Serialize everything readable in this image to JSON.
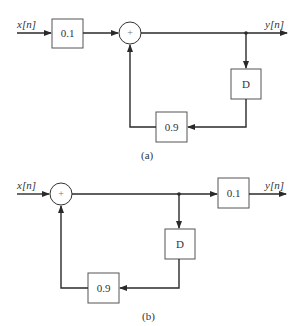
{
  "diagram_a": {
    "caption": "(a)",
    "input_label": "x[n]",
    "output_label": "y[n]",
    "gain_box": "0.1",
    "sum_symbol": "+",
    "delay_box": "D",
    "feedback_box": "0.9"
  },
  "diagram_b": {
    "caption": "(b)",
    "input_label": "x[n]",
    "output_label": "y[n]",
    "gain_box": "0.1",
    "sum_symbol": "+",
    "delay_box": "D",
    "feedback_box": "0.9"
  },
  "colors": {
    "line": "#2a2a2a",
    "box_border": "#555555",
    "text": "#333333",
    "background": "#ffffff"
  }
}
